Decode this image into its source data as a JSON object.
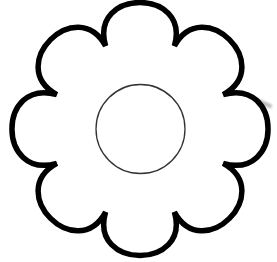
{
  "image": {
    "subject": "flower outline",
    "petal_count": 8,
    "colors": {
      "background": "#ffffff",
      "outline": "#000000",
      "center_outline": "#333333",
      "smudge": "#b8b8b8"
    },
    "stroke_widths": {
      "petals": 5.5,
      "center": 1.3
    }
  }
}
